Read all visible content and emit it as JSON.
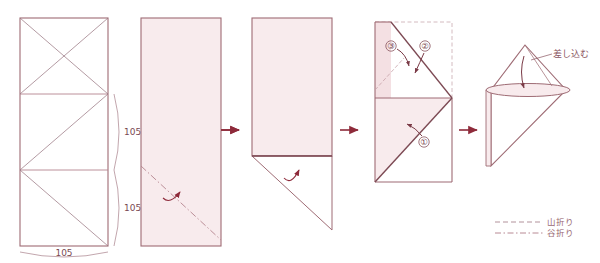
{
  "figure": {
    "panel_count": 5,
    "colors": {
      "paper_fill": "#f8ebed",
      "outline": "#9e6b74",
      "fold_line": "#b0808a",
      "arrow": "#8e2a3a",
      "dark_edge": "#6d3d46",
      "legend_text": "#9a6a74",
      "dimension_text": "#7a4a52",
      "dashed_ghost": "#c9a9b0"
    }
  },
  "panels": [
    {
      "id": "panel-1-crease-pattern",
      "name": "crease-pattern",
      "dimensions": [
        {
          "id": "dim-bottom",
          "value": "105",
          "position": "bottom"
        },
        {
          "id": "dim-right-lower",
          "value": "105",
          "position": "right-lower"
        },
        {
          "id": "dim-right-upper",
          "value": "105",
          "position": "right-upper"
        }
      ]
    },
    {
      "id": "panel-2-folded-strip",
      "name": "folded-strip",
      "fold_type": "valley",
      "arrow": "fold-up-arrow"
    },
    {
      "id": "panel-3-triangle-flap",
      "name": "triangle-flap",
      "arrow": "fold-up-arrow"
    },
    {
      "id": "panel-4-numbered-folds",
      "name": "numbered-folds",
      "steps": [
        {
          "id": "step-1",
          "label": "①"
        },
        {
          "id": "step-2",
          "label": "②"
        },
        {
          "id": "step-3",
          "label": "③"
        }
      ]
    },
    {
      "id": "panel-5-finished",
      "name": "finished-form",
      "annotation": {
        "id": "insert-label",
        "label": "差し込む"
      }
    }
  ],
  "separators": [
    {
      "id": "arrow-1",
      "label": "→"
    },
    {
      "id": "arrow-2",
      "label": "→"
    },
    {
      "id": "arrow-3",
      "label": "→"
    },
    {
      "id": "arrow-4",
      "label": "→"
    }
  ],
  "legend": {
    "items": [
      {
        "id": "legend-mountain",
        "label": "山折り",
        "line_style": "dashed"
      },
      {
        "id": "legend-valley",
        "label": "谷折り",
        "line_style": "dash-dot"
      }
    ]
  }
}
